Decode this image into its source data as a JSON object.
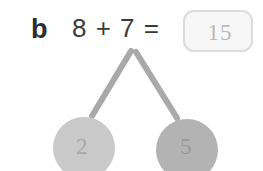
{
  "worksheet": {
    "question_label": "b",
    "equation": "8 + 7 =",
    "answer_box": {
      "value": "15",
      "placeholder": ""
    },
    "number_bond": {
      "parts": [
        {
          "value": "2",
          "fill": "#c9c9c9"
        },
        {
          "value": "5",
          "fill": "#b3b3b3"
        }
      ],
      "connector_color": "#a9a9a9"
    }
  },
  "colors": {
    "background": "#ffffff",
    "ink": "#3a3a3a",
    "pencil": "#b9b9b9",
    "box_border": "#dcdcdc",
    "box_fill": "#f7f7f7"
  }
}
